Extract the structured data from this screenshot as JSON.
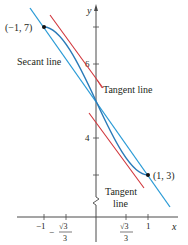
{
  "figure": {
    "function": "f(x) = x^3 - 3x + 5",
    "colors": {
      "axis": "#4a4a4a",
      "curve": "#2a7ab8",
      "secant": "#2a9bd6",
      "tangent": "#d0343a",
      "text": "#231f20",
      "point": "#111111"
    },
    "axes": {
      "x_label": "x",
      "y_label": "y",
      "x_ticks": [
        {
          "value": -1,
          "label": "−1"
        },
        {
          "value": -0.5774,
          "label_num": "√3",
          "label_den": "3",
          "label_sign": "−"
        },
        {
          "value": 0.5774,
          "label_num": "√3",
          "label_den": "3",
          "label_sign": ""
        },
        {
          "value": 1,
          "label": "1"
        }
      ],
      "y_ticks": [
        {
          "value": 7,
          "label": ""
        },
        {
          "value": 6,
          "label": "6"
        },
        {
          "value": 4,
          "label": "4"
        },
        {
          "value": 3,
          "label": ""
        }
      ],
      "y_axis_break": true
    },
    "points": [
      {
        "x": -1,
        "y": 7,
        "label": "(−1, 7)"
      },
      {
        "x": 1,
        "y": 3,
        "label": "(1, 3)"
      }
    ],
    "annotations": {
      "secant": "Secant line",
      "tangent_upper": "Tangent line",
      "tangent_lower_1": "Tangent",
      "tangent_lower_2": "line"
    }
  }
}
